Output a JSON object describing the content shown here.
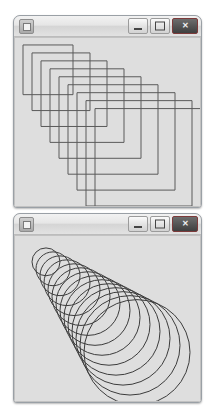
{
  "page": {
    "background_color": "#ffffff",
    "window_count": 2
  },
  "windows": [
    {
      "id": "squares",
      "title": "",
      "icon": "app-window-icon",
      "frame_color": "#9aa0a6",
      "canvas_background": "#dedede",
      "controls": {
        "minimize_label": "—",
        "maximize_label": "❑",
        "close_label": "✕",
        "close_color": "#3f3f3f",
        "maximize_state": "restore"
      }
    },
    {
      "id": "circles",
      "title": "",
      "icon": "app-window-icon",
      "frame_color": "#9aa0a6",
      "canvas_background": "#dedede",
      "controls": {
        "minimize_label": "—",
        "maximize_label": "□",
        "close_label": "✕",
        "close_color": "#3f3f3f",
        "maximize_state": "maximize"
      }
    }
  ],
  "chart_data": [
    {
      "type": "scatter",
      "id": "nested-offset-squares",
      "title": "",
      "xlabel": "",
      "ylabel": "",
      "stroke_color": "#5a5a5a",
      "stroke_width": 1,
      "fill": "none",
      "grid": false,
      "legend": null,
      "xlim": [
        0,
        187
      ],
      "ylim": [
        0,
        171
      ],
      "shape": "square",
      "count": 9,
      "description": "Nine open squares, each larger than the previous and offset down-and-right, forming a diagonal cascade from upper-left to lower-right.",
      "squares": [
        {
          "index": 1,
          "x": 9,
          "y": 8,
          "size": 50
        },
        {
          "index": 2,
          "x": 18,
          "y": 16,
          "size": 58
        },
        {
          "index": 3,
          "x": 27,
          "y": 24,
          "size": 66
        },
        {
          "index": 4,
          "x": 36,
          "y": 32,
          "size": 74
        },
        {
          "index": 5,
          "x": 45,
          "y": 40,
          "size": 82
        },
        {
          "index": 6,
          "x": 54,
          "y": 48,
          "size": 90
        },
        {
          "index": 7,
          "x": 63,
          "y": 56,
          "size": 98
        },
        {
          "index": 8,
          "x": 72,
          "y": 64,
          "size": 106
        },
        {
          "index": 9,
          "x": 81,
          "y": 72,
          "size": 114
        }
      ]
    },
    {
      "type": "scatter",
      "id": "growing-circle-cone",
      "title": "",
      "xlabel": "",
      "ylabel": "",
      "stroke_color": "#3c3c3c",
      "stroke_width": 1,
      "fill": "none",
      "grid": false,
      "legend": null,
      "xlim": [
        0,
        187
      ],
      "ylim": [
        0,
        168
      ],
      "shape": "circle",
      "count": 14,
      "description": "Fourteen open circles with linearly increasing radius, centers marching along a diagonal from upper-left to lower-right, producing a cone or funnel silhouette.",
      "circles": [
        {
          "index": 1,
          "cx": 32,
          "cy": 27,
          "r": 14
        },
        {
          "index": 2,
          "cx": 39,
          "cy": 34,
          "r": 17
        },
        {
          "index": 3,
          "cx": 46,
          "cy": 41,
          "r": 20
        },
        {
          "index": 4,
          "cx": 53,
          "cy": 48,
          "r": 23
        },
        {
          "index": 5,
          "cx": 60,
          "cy": 55,
          "r": 26
        },
        {
          "index": 6,
          "cx": 67,
          "cy": 62,
          "r": 29
        },
        {
          "index": 7,
          "cx": 74,
          "cy": 69,
          "r": 32
        },
        {
          "index": 8,
          "cx": 81,
          "cy": 76,
          "r": 35
        },
        {
          "index": 9,
          "cx": 88,
          "cy": 83,
          "r": 38
        },
        {
          "index": 10,
          "cx": 95,
          "cy": 90,
          "r": 41
        },
        {
          "index": 11,
          "cx": 102,
          "cy": 97,
          "r": 44
        },
        {
          "index": 12,
          "cx": 109,
          "cy": 104,
          "r": 47
        },
        {
          "index": 13,
          "cx": 116,
          "cy": 111,
          "r": 50
        },
        {
          "index": 14,
          "cx": 123,
          "cy": 118,
          "r": 53
        }
      ]
    }
  ]
}
